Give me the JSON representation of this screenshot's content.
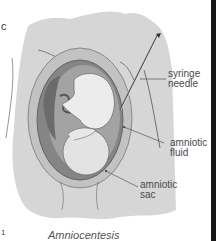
{
  "figure": {
    "panel_letter": "c",
    "bottom_mark": "1",
    "caption": "Amniocentesis",
    "labels": {
      "syringe_line1": "syringe",
      "syringe_line2": "needle",
      "fluid_line1": "amniotic",
      "fluid_line2": "fluid",
      "sac_line1": "amniotic",
      "sac_line2": "sac"
    }
  },
  "colors": {
    "body_gray": "#d4d4d4",
    "uterus_wall": "#bdbdbd",
    "sac_dark": "#7a7a7a",
    "fluid": "#9c9c9c",
    "fetus": "#e8e8e8",
    "right_bar": "#161616"
  }
}
